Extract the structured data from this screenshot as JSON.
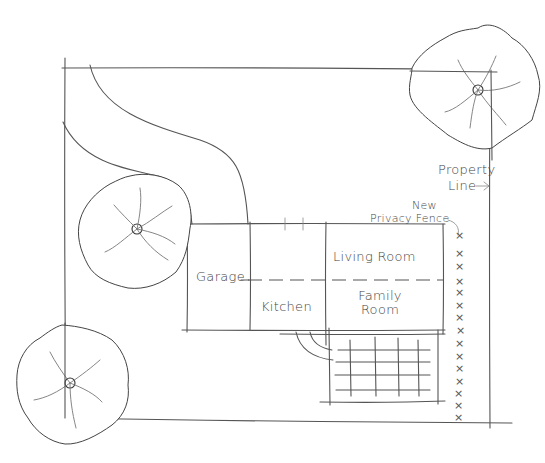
{
  "diagram": {
    "type": "hand-drawn site plan",
    "colors": {
      "line": "#555555",
      "text": "#444444",
      "background": "#ffffff"
    },
    "rooms": [
      {
        "id": "garage",
        "label": "Garage"
      },
      {
        "id": "kitchen",
        "label": "Kitchen"
      },
      {
        "id": "living-room",
        "label": "Living Room"
      },
      {
        "id": "family-room",
        "label_line1": "Family",
        "label_line2": "Room"
      }
    ],
    "annotations": {
      "property_line": {
        "line1": "Property",
        "line2": "Line",
        "arrow": "→"
      },
      "fence": {
        "line1": "New",
        "line2": "Privacy Fence"
      }
    },
    "fence_marker": "×",
    "fence_marker_count": 18,
    "trees": [
      {
        "id": "tree-top-right",
        "icon": "tree-icon"
      },
      {
        "id": "tree-left-middle",
        "icon": "tree-icon"
      },
      {
        "id": "tree-bottom-left",
        "icon": "tree-icon"
      }
    ],
    "features": [
      "driveway",
      "house",
      "patio-grid",
      "privacy-fence",
      "property-boundary"
    ]
  }
}
